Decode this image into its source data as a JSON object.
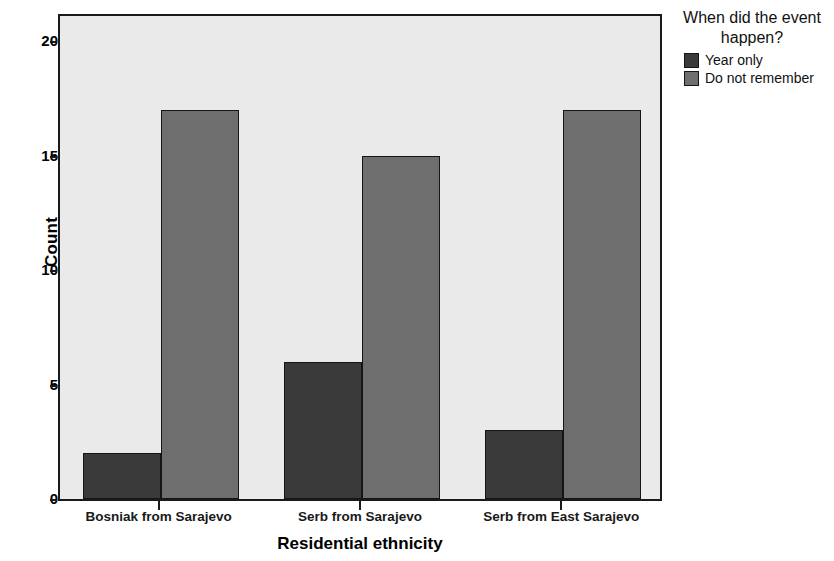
{
  "chart_data": {
    "type": "bar",
    "title": "",
    "xlabel": "Residential ethnicity",
    "ylabel": "Count",
    "categories": [
      "Bosniak from Sarajevo",
      "Serb from Sarajevo",
      "Serb from East Sarajevo"
    ],
    "series": [
      {
        "name": "Year only",
        "color": "#3a3a3a",
        "values": [
          2,
          6,
          3
        ]
      },
      {
        "name": "Do not remember",
        "color": "#6e6e6e",
        "values": [
          17,
          15,
          17
        ]
      }
    ],
    "ylim": [
      0,
      21.2
    ],
    "yticks": [
      0,
      5,
      10,
      15,
      20
    ],
    "ytick_labels": [
      "0",
      "5",
      "10",
      "15",
      "20"
    ],
    "grid": false,
    "legend_position": "right",
    "legend_title": "When did the event happen?",
    "plot_background": "#eaeaea",
    "axis_color": "#1a1a1a"
  },
  "legend": {
    "title_line1": "When did the event",
    "title_line2": "happen?",
    "items": [
      {
        "label": "Year only"
      },
      {
        "label": "Do not remember"
      }
    ]
  },
  "axes": {
    "y_title": "Count",
    "x_title": "Residential ethnicity"
  }
}
